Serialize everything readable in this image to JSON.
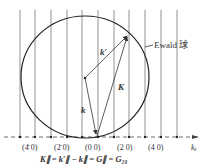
{
  "diagram": {
    "ewald_label": "Ewald 球",
    "vector_labels": {
      "k_prime": "k′",
      "k": "k",
      "K": "K"
    },
    "axis_label": "kₓ",
    "rod_labels": [
      "(4̄ 0)",
      "(2̄ 0)",
      "(0 0)",
      "(2 0)",
      "(4 0)"
    ],
    "equation": "K∥ = k′∥ − k∥ = G∥ = G₂₀",
    "colors": {
      "line": "#555555",
      "circle": "#222222",
      "text": "#333333"
    }
  }
}
